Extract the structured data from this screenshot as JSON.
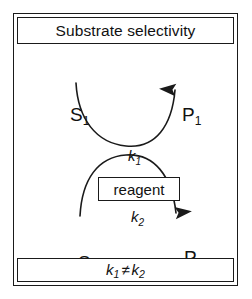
{
  "figure": {
    "title": "Substrate selectivity",
    "footer": {
      "left_rate": "k",
      "left_sub": "1",
      "operator": "≠",
      "right_rate": "k",
      "right_sub": "2"
    },
    "center_node": {
      "label": "reagent"
    },
    "colors": {
      "stroke": "#1a1a1a",
      "text": "#111111",
      "background": "#ffffff"
    },
    "species": [
      {
        "id": "s1",
        "base": "S",
        "sub": "1",
        "role": "substrate",
        "position": "upper-left"
      },
      {
        "id": "p1",
        "base": "P",
        "sub": "1",
        "role": "product",
        "position": "upper-right"
      },
      {
        "id": "s2",
        "base": "S",
        "sub": "2",
        "role": "substrate",
        "position": "lower-left"
      },
      {
        "id": "p2",
        "base": "P",
        "sub": "2",
        "role": "product",
        "position": "lower-right"
      }
    ],
    "reactions": [
      {
        "id": "k1",
        "base": "k",
        "sub": "1",
        "from": "S1",
        "to": "P1",
        "arrow_direction": "up-right",
        "curve": "dips downward through reagent"
      },
      {
        "id": "k2",
        "base": "k",
        "sub": "2",
        "from": "S2",
        "to": "P2",
        "arrow_direction": "down-right",
        "curve": "arcs upward through reagent"
      }
    ]
  }
}
